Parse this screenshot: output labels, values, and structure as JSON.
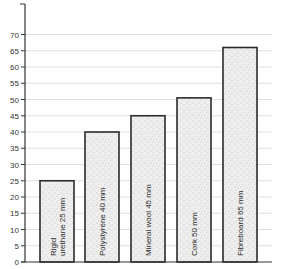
{
  "chart_data": {
    "type": "bar",
    "title": "",
    "xlabel": "",
    "ylabel": "",
    "ylim": [
      0,
      75
    ],
    "yticks": [
      0,
      5,
      10,
      15,
      20,
      25,
      30,
      35,
      40,
      45,
      50,
      55,
      60,
      65,
      70
    ],
    "grid": true,
    "legend": null,
    "categories": [
      "Rigid urethane 25 mm",
      "Polystyrene 40 mm",
      "Mineral wool 45 mm",
      "Cork 50 mm",
      "Fibreboard 65 mm"
    ],
    "label_lines": [
      [
        "Rigid",
        "urethane 25 mm"
      ],
      [
        "Polystyrene 40 mm"
      ],
      [
        "Mineral wool 45 mm"
      ],
      [
        "Cork 50 mm"
      ],
      [
        "Fibreboard 65 mm"
      ]
    ],
    "values": [
      25,
      40,
      45,
      50.5,
      66
    ]
  },
  "style": {
    "axis_color": "#333333",
    "grid_color": "#d8d8d8",
    "bar_fill": "#ededed",
    "bar_stroke": "#2b2b2b",
    "speckle_color": "#8a8a8a"
  }
}
